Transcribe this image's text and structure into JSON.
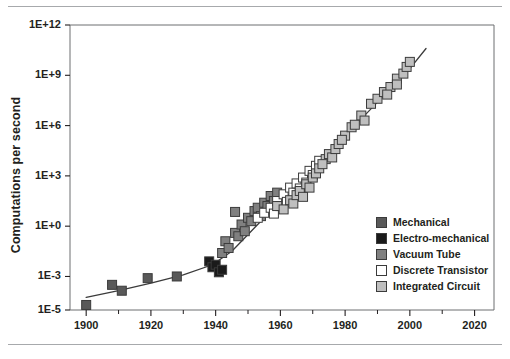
{
  "figure": {
    "has_top_rule": true,
    "has_bottom_rule": true,
    "rule_color": "#a7a9ac"
  },
  "chart_data": {
    "type": "scatter",
    "title": "",
    "subtitle": "",
    "xlabel": "",
    "ylabel": "Computations per second",
    "xlim": [
      1895,
      2026
    ],
    "ylim": [
      -5,
      12
    ],
    "y_scale": "log10",
    "grid": false,
    "legend_position": "inside-bottom-right",
    "x_ticks_major": [
      1900,
      1920,
      1940,
      1960,
      1980,
      2000,
      2020
    ],
    "x_tick_labels": [
      "1900",
      "1920",
      "1940",
      "1960",
      "1980",
      "2000",
      "2020"
    ],
    "x_ticks_minor": [
      1910,
      1930,
      1950,
      1970,
      1990,
      2010
    ],
    "y_ticks": [
      12,
      9,
      6,
      3,
      0,
      -3,
      -5
    ],
    "y_tick_labels": [
      "1E+12",
      "1E+9",
      "1E+6",
      "1E+3",
      "1E+0",
      "1E-3",
      "1E-5"
    ],
    "trend_line": {
      "label": "fitted exponential trend",
      "color": "#3b3b3b",
      "points": [
        [
          1900,
          -4.25
        ],
        [
          1910,
          -3.85
        ],
        [
          1920,
          -3.4
        ],
        [
          1930,
          -2.9
        ],
        [
          1939,
          -2.3
        ],
        [
          1945,
          -1.5
        ],
        [
          1950,
          -0.5
        ],
        [
          1955,
          0.5
        ],
        [
          1960,
          1.4
        ],
        [
          1965,
          2.3
        ],
        [
          1970,
          3.3
        ],
        [
          1975,
          4.4
        ],
        [
          1980,
          5.4
        ],
        [
          1985,
          6.4
        ],
        [
          1990,
          7.4
        ],
        [
          1995,
          8.4
        ],
        [
          2000,
          9.4
        ],
        [
          2005,
          10.6
        ]
      ]
    },
    "series": [
      {
        "name": "Mechanical",
        "color": "#595959",
        "marker": "square",
        "filled": true,
        "points": [
          [
            1900,
            -4.7
          ],
          [
            1908,
            -3.5
          ],
          [
            1911,
            -3.85
          ],
          [
            1919,
            -3.1
          ],
          [
            1928,
            -3.0
          ]
        ]
      },
      {
        "name": "Electro-mechanical",
        "color": "#1a1a1a",
        "marker": "square",
        "filled": true,
        "points": [
          [
            1938,
            -2.1
          ],
          [
            1939,
            -2.45
          ],
          [
            1940,
            -2.3
          ],
          [
            1941,
            -2.75
          ],
          [
            1942,
            -2.6
          ]
        ]
      },
      {
        "name": "Vacuum Tube",
        "color": "#808080",
        "marker": "square",
        "filled": true,
        "points": [
          [
            1942,
            -1.6
          ],
          [
            1943,
            -0.9
          ],
          [
            1944,
            -1.3
          ],
          [
            1946,
            -0.4
          ],
          [
            1947,
            -0.6
          ],
          [
            1948,
            0.1
          ],
          [
            1949,
            -0.3
          ],
          [
            1950,
            0.5
          ],
          [
            1951,
            0.3
          ],
          [
            1952,
            0.9
          ],
          [
            1953,
            1.1
          ],
          [
            1954,
            0.6
          ],
          [
            1955,
            1.4
          ],
          [
            1956,
            1.2
          ],
          [
            1957,
            1.8
          ],
          [
            1958,
            1.5
          ],
          [
            1959,
            2.0
          ],
          [
            1946,
            0.85
          ]
        ]
      },
      {
        "name": "Discrete Transistor",
        "color": "#ffffff",
        "marker": "square",
        "filled": false,
        "points": [
          [
            1953,
            0.5
          ],
          [
            1955,
            0.8
          ],
          [
            1957,
            1.1
          ],
          [
            1958,
            0.75
          ],
          [
            1959,
            1.5
          ],
          [
            1960,
            1.2
          ],
          [
            1961,
            1.9
          ],
          [
            1962,
            1.45
          ],
          [
            1963,
            2.3
          ],
          [
            1964,
            2.0
          ],
          [
            1965,
            2.55
          ],
          [
            1966,
            2.25
          ],
          [
            1967,
            2.9
          ],
          [
            1968,
            2.6
          ],
          [
            1969,
            3.3
          ],
          [
            1970,
            3.05
          ],
          [
            1971,
            3.6
          ],
          [
            1972,
            3.9
          ]
        ]
      },
      {
        "name": "Integrated Circuit",
        "color": "#bfbfbf",
        "marker": "square",
        "filled": true,
        "points": [
          [
            1959,
            1.2
          ],
          [
            1961,
            1.0
          ],
          [
            1963,
            1.55
          ],
          [
            1964,
            1.35
          ],
          [
            1965,
            1.85
          ],
          [
            1966,
            2.1
          ],
          [
            1967,
            1.75
          ],
          [
            1968,
            2.5
          ],
          [
            1969,
            2.3
          ],
          [
            1970,
            2.9
          ],
          [
            1971,
            3.15
          ],
          [
            1972,
            3.45
          ],
          [
            1974,
            4.0
          ],
          [
            1975,
            4.3
          ],
          [
            1976,
            4.1
          ],
          [
            1977,
            4.6
          ],
          [
            1978,
            4.9
          ],
          [
            1980,
            5.4
          ],
          [
            1982,
            5.9
          ],
          [
            1985,
            6.6
          ],
          [
            1988,
            7.3
          ],
          [
            1990,
            7.6
          ],
          [
            1992,
            8.0
          ],
          [
            1994,
            8.3
          ],
          [
            1996,
            8.8
          ],
          [
            1998,
            9.1
          ],
          [
            1999,
            9.5
          ],
          [
            2000,
            9.8
          ],
          [
            1996,
            8.45
          ],
          [
            1993,
            7.85
          ],
          [
            1986,
            6.3
          ],
          [
            1983,
            6.05
          ],
          [
            1979,
            5.15
          ],
          [
            1973,
            3.7
          ]
        ]
      }
    ],
    "legend_entries": [
      {
        "label": "Mechanical",
        "color": "#595959",
        "filled": true
      },
      {
        "label": "Electro-mechanical",
        "color": "#1a1a1a",
        "filled": true
      },
      {
        "label": "Vacuum Tube",
        "color": "#808080",
        "filled": true
      },
      {
        "label": "Discrete Transistor",
        "color": "#ffffff",
        "filled": false
      },
      {
        "label": "Integrated Circuit",
        "color": "#bfbfbf",
        "filled": true
      }
    ]
  }
}
